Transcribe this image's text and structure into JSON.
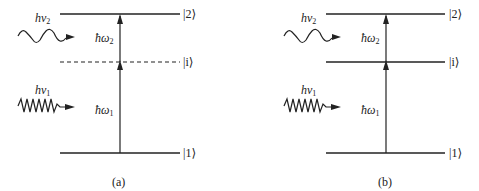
{
  "panels": [
    {
      "id": "a",
      "caption": "(a)",
      "intermediate_state_style": "dashed",
      "levels": [
        {
          "label": "|2⟩",
          "y": 14
        },
        {
          "label": "|i⟩",
          "y": 62
        },
        {
          "label": "|1⟩",
          "y": 153
        }
      ],
      "transitions": [
        {
          "label_main": "ħω",
          "label_sub": "2",
          "from": "i",
          "to": "2"
        },
        {
          "label_main": "ħω",
          "label_sub": "1",
          "from": "1",
          "to": "i"
        }
      ],
      "photons": [
        {
          "label_main": "hν",
          "label_sub": "2",
          "waves": 3
        },
        {
          "label_main": "hν",
          "label_sub": "1",
          "waves": 6
        }
      ]
    },
    {
      "id": "b",
      "caption": "(b)",
      "intermediate_state_style": "solid",
      "levels": [
        {
          "label": "|2⟩",
          "y": 14
        },
        {
          "label": "|i⟩",
          "y": 62
        },
        {
          "label": "|1⟩",
          "y": 153
        }
      ],
      "transitions": [
        {
          "label_main": "ħω",
          "label_sub": "2",
          "from": "i",
          "to": "2"
        },
        {
          "label_main": "ħω",
          "label_sub": "1",
          "from": "1",
          "to": "i"
        }
      ],
      "photons": [
        {
          "label_main": "hν",
          "label_sub": "2",
          "waves": 3
        },
        {
          "label_main": "hν",
          "label_sub": "1",
          "waves": 6
        }
      ]
    }
  ],
  "colors": {
    "line": "#222222",
    "background": "#ffffff"
  }
}
